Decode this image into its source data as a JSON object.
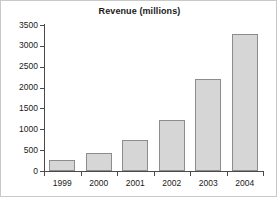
{
  "chart_data": {
    "type": "bar",
    "title": "Revenue (millions)",
    "xlabel": "",
    "ylabel": "",
    "categories": [
      "1999",
      "2000",
      "2001",
      "2002",
      "2003",
      "2004"
    ],
    "values": [
      260,
      430,
      750,
      1220,
      2200,
      3290
    ],
    "ylim": [
      0,
      3500
    ],
    "yticks": [
      "0",
      "500",
      "1000",
      "1500",
      "2000",
      "2500",
      "3000",
      "3500"
    ],
    "ytick_values": [
      0,
      500,
      1000,
      1500,
      2000,
      2500,
      3000,
      3500
    ],
    "grid": false,
    "legend": null,
    "bar_fill_color": "#d6d6d6",
    "bar_border_color": "#8c8c8c",
    "axis_color": "#4a4a4a",
    "background_color": "#ffffff"
  }
}
